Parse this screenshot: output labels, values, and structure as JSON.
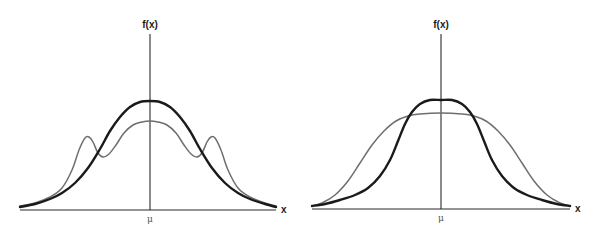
{
  "chart_data": [
    {
      "type": "line",
      "title": "",
      "ylabel": "f(x)",
      "xlabel": "x",
      "xtick_labels": [
        "μ"
      ],
      "grid": false,
      "legend": null,
      "description": "Unimodal normal density (dark) vs. trimodal symmetric density with same center (gray)",
      "series": [
        {
          "name": "dark-normal",
          "style": "dark-thick",
          "points_px": [
            [
              20,
              207
            ],
            [
              35,
              204
            ],
            [
              50,
              199
            ],
            [
              62,
              193
            ],
            [
              75,
              183
            ],
            [
              88,
              168
            ],
            [
              100,
              149
            ],
            [
              110,
              131
            ],
            [
              120,
              117
            ],
            [
              130,
              107
            ],
            [
              140,
              102
            ],
            [
              150,
              101
            ],
            [
              160,
              102
            ],
            [
              170,
              107
            ],
            [
              180,
              117
            ],
            [
              190,
              131
            ],
            [
              200,
              149
            ],
            [
              212,
              168
            ],
            [
              225,
              183
            ],
            [
              238,
              193
            ],
            [
              250,
              199
            ],
            [
              265,
              204
            ],
            [
              276,
              207
            ]
          ]
        },
        {
          "name": "gray-trimodal",
          "style": "gray-thin",
          "points_px": [
            [
              20,
              206
            ],
            [
              35,
              203
            ],
            [
              50,
              197
            ],
            [
              62,
              188
            ],
            [
              72,
              170
            ],
            [
              79,
              150
            ],
            [
              85,
              138
            ],
            [
              89,
              137
            ],
            [
              93,
              142
            ],
            [
              98,
              153
            ],
            [
              103,
              157
            ],
            [
              109,
              154
            ],
            [
              116,
              145
            ],
            [
              124,
              133
            ],
            [
              133,
              125
            ],
            [
              142,
              122
            ],
            [
              150,
              121
            ],
            [
              158,
              122
            ],
            [
              167,
              125
            ],
            [
              176,
              133
            ],
            [
              184,
              145
            ],
            [
              191,
              154
            ],
            [
              197,
              157
            ],
            [
              202,
              153
            ],
            [
              207,
              142
            ],
            [
              211,
              137
            ],
            [
              215,
              138
            ],
            [
              221,
              150
            ],
            [
              228,
              170
            ],
            [
              238,
              188
            ],
            [
              250,
              197
            ],
            [
              265,
              203
            ],
            [
              276,
              206
            ]
          ]
        }
      ],
      "axes_px": {
        "x0": 20,
        "x1": 276,
        "baseline_y": 210,
        "yaxis_x": 150,
        "yaxis_top": 34
      },
      "label_px": {
        "f": [
          150,
          19
        ],
        "x": [
          281,
          204
        ],
        "mu": [
          150,
          214
        ]
      }
    },
    {
      "type": "line",
      "title": "",
      "ylabel": "f(x)",
      "xlabel": "x",
      "xtick_labels": [
        "μ"
      ],
      "grid": false,
      "legend": null,
      "description": "Peaked heavy-tailed density (dark) vs. broader normal density (gray), both centered at μ",
      "series": [
        {
          "name": "dark-peaked",
          "style": "dark-thick",
          "points_px": [
            [
              312,
              206
            ],
            [
              325,
              204
            ],
            [
              340,
              200
            ],
            [
              355,
              195
            ],
            [
              368,
              188
            ],
            [
              380,
              176
            ],
            [
              390,
              160
            ],
            [
              398,
              141
            ],
            [
              405,
              124
            ],
            [
              412,
              112
            ],
            [
              420,
              104
            ],
            [
              430,
              100
            ],
            [
              441,
              100
            ],
            [
              452,
              100
            ],
            [
              462,
              104
            ],
            [
              470,
              112
            ],
            [
              477,
              124
            ],
            [
              484,
              141
            ],
            [
              492,
              160
            ],
            [
              502,
              176
            ],
            [
              514,
              188
            ],
            [
              527,
              195
            ],
            [
              542,
              200
            ],
            [
              557,
              204
            ],
            [
              570,
              206
            ]
          ]
        },
        {
          "name": "gray-normal",
          "style": "gray-thin",
          "points_px": [
            [
              312,
              206
            ],
            [
              322,
              203
            ],
            [
              335,
              195
            ],
            [
              348,
              181
            ],
            [
              360,
              163
            ],
            [
              372,
              145
            ],
            [
              384,
              131
            ],
            [
              396,
              121
            ],
            [
              408,
              116
            ],
            [
              420,
              114
            ],
            [
              441,
              113
            ],
            [
              462,
              114
            ],
            [
              474,
              116
            ],
            [
              486,
              121
            ],
            [
              498,
              131
            ],
            [
              510,
              145
            ],
            [
              522,
              163
            ],
            [
              534,
              181
            ],
            [
              547,
              195
            ],
            [
              560,
              203
            ],
            [
              570,
              206
            ]
          ]
        }
      ],
      "axes_px": {
        "x0": 312,
        "x1": 570,
        "baseline_y": 209,
        "yaxis_x": 441,
        "yaxis_top": 34
      },
      "label_px": {
        "f": [
          441,
          19
        ],
        "x": [
          575,
          203
        ],
        "mu": [
          441,
          213
        ]
      }
    }
  ]
}
